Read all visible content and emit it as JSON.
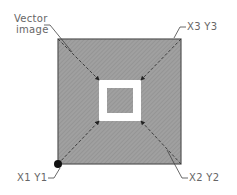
{
  "diagram": {
    "labels": {
      "vector_image_line1": "Vector",
      "vector_image_line2": "image",
      "top_right": "X3  Y3",
      "bottom_right": "X2  Y2",
      "bottom_left": "X1  Y1"
    },
    "colors": {
      "fill": "#9a9a9a",
      "border": "#555555",
      "hole": "#ffffff",
      "text": "#666666",
      "line": "#333333"
    }
  }
}
